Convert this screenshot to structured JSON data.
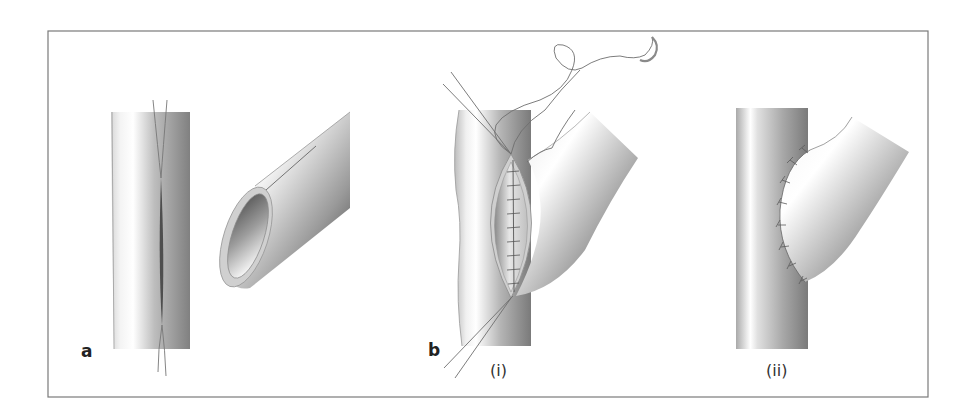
{
  "figure": {
    "frame_color": "#7a7a7a",
    "panels": [
      {
        "id": "a",
        "label": "a"
      },
      {
        "id": "b",
        "label": "b",
        "subpanels": [
          {
            "id": "i",
            "label": "(i)"
          },
          {
            "id": "ii",
            "label": "(ii)"
          }
        ]
      }
    ],
    "colors": {
      "vessel_light": "#fbfbfb",
      "vessel_mid": "#c4c4c4",
      "vessel_dark": "#7d7d7d",
      "suture": "#6e6e6e",
      "incision": "#4a4a4a"
    }
  }
}
